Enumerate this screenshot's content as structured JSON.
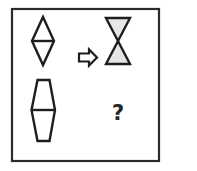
{
  "puzzle": {
    "type": "visual-analogy",
    "frame": {
      "stroke": "#2b2b2b"
    },
    "shapes": {
      "source_top": {
        "kind": "diamond-with-horizontal-line",
        "fill": "#ffffff"
      },
      "arrow": {
        "kind": "right-arrow-outline",
        "fill": "#ffffff"
      },
      "result_top": {
        "kind": "hourglass",
        "fill": "#e6e6e6"
      },
      "source_bottom": {
        "kind": "elongated-hexagon-with-horizontal-line",
        "fill": "#ffffff"
      }
    },
    "answer_placeholder": "?",
    "stroke_color": "#1e1e1e"
  }
}
